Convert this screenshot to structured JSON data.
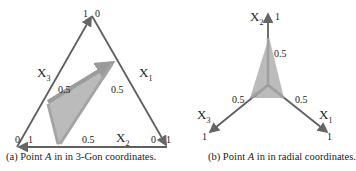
{
  "figure_a": {
    "axes": {
      "x1": {
        "label": "X",
        "sub": "1",
        "tick_start": "0",
        "tick_mid": "0.5",
        "tick_end": "1"
      },
      "x2": {
        "label": "X",
        "sub": "2",
        "tick_start": "0",
        "tick_mid": "0.5",
        "tick_end": "1"
      },
      "x3": {
        "label": "X",
        "sub": "3",
        "tick_start": "0",
        "tick_mid": "0.5",
        "tick_end": "1"
      }
    },
    "corner_labels": {
      "top_left": "1",
      "top_right": "0",
      "bl_left": "0",
      "bl_right": "1",
      "br_left": "0",
      "br_right": "1"
    },
    "caption_prefix": "(a)  Point ",
    "caption_var": "A",
    "caption_suffix": " in in 3-Gon coordinates."
  },
  "figure_b": {
    "axes": {
      "x1": {
        "label": "X",
        "sub": "1",
        "tick_mid": "0.5",
        "tick_end": "1"
      },
      "x2": {
        "label": "X",
        "sub": "2",
        "tick_mid": "0.5",
        "tick_end": "1"
      },
      "x3": {
        "label": "X",
        "sub": "3",
        "tick_mid": "0.5",
        "tick_end": "1"
      }
    },
    "caption_prefix": "(b) Point ",
    "caption_var": "A",
    "caption_suffix": " in in radial coordinates."
  },
  "colors": {
    "axis": "#5f5f5f",
    "fill": "#b0b0b0",
    "text": "#222222"
  }
}
